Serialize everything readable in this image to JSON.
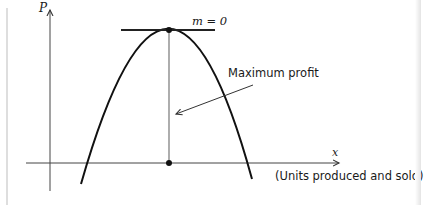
{
  "figure": {
    "y_axis_label": "P",
    "x_axis_label": "x",
    "x_axis_caption": "(Units produced and sold)",
    "tangent_label": "m = 0",
    "annotation": "Maximum profit"
  },
  "colors": {
    "ink": "#1a1a1a",
    "axis": "#555555",
    "background": "#ffffff"
  }
}
